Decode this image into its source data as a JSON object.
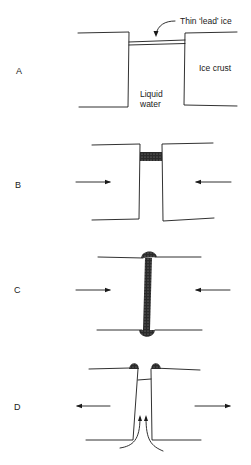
{
  "panels": [
    {
      "id": "A",
      "label": "A"
    },
    {
      "id": "B",
      "label": "B"
    },
    {
      "id": "C",
      "label": "C"
    },
    {
      "id": "D",
      "label": "D"
    }
  ],
  "annotations": {
    "lead_ice": "Thin ‘lead’ ice",
    "ice_crust": "Ice crust",
    "liquid_line1": "Liquid",
    "liquid_line2": "water"
  },
  "colors": {
    "ink": "#1a1a1a",
    "stipple": "#3a3a3a"
  }
}
